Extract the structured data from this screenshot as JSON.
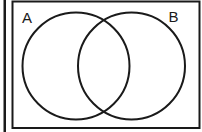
{
  "diagram": {
    "type": "venn",
    "title": "",
    "colors": {
      "stroke": "#1a1a1a",
      "background": "#ffffff"
    },
    "universe": {
      "label": ""
    },
    "sets": [
      {
        "id": "A",
        "label": "A"
      },
      {
        "id": "B",
        "label": "B"
      }
    ],
    "regions": {
      "A_only": "",
      "A_and_B": "",
      "B_only": "",
      "outside": ""
    }
  }
}
